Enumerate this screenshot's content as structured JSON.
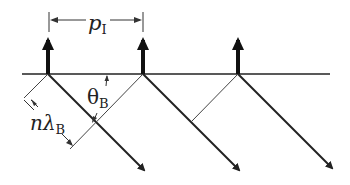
{
  "diagram": {
    "labels": {
      "period": "p",
      "period_sub": "I",
      "angle": "θ",
      "angle_sub": "B",
      "path": "nλ",
      "path_sub": "B"
    },
    "emitters": [
      {
        "x": 48
      },
      {
        "x": 143
      },
      {
        "x": 238
      }
    ],
    "surface_y": 74,
    "colors": {
      "line": "#222222",
      "background": "#ffffff"
    }
  }
}
